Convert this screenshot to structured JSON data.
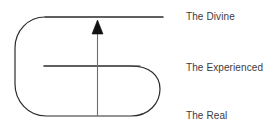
{
  "diagram": {
    "background_color": "#ffffff",
    "stroke_color": "#2b2b2b",
    "text_color": "#3b3b3b",
    "labels": [
      {
        "id": "divine",
        "text": "The Divine"
      },
      {
        "id": "experienced",
        "text": "The Experienced"
      },
      {
        "id": "real",
        "text": "The Real"
      }
    ],
    "shapes": {
      "outer_loop_name": "rounded-loop-outline",
      "top_line_name": "divine-level-line",
      "middle_line_name": "experienced-level-line",
      "arrow_name": "ascending-arrow",
      "arrow_direction": "up"
    }
  }
}
